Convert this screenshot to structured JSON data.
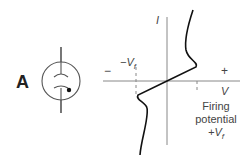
{
  "figure": {
    "panel_label": "A",
    "component": "gas-discharge-tube-symbol",
    "axes": {
      "x_label": "V",
      "y_label": "I",
      "negative_sign": "−",
      "positive_sign": "+"
    },
    "annotations": {
      "neg_threshold": "−V",
      "neg_threshold_sub": "f",
      "firing_line1": "Firing",
      "firing_line2": "potential",
      "pos_threshold": "+V",
      "pos_threshold_sub": "f"
    },
    "colors": {
      "curve": "#111111",
      "axes": "#888888",
      "symbol": "#555555",
      "text": "#444444"
    }
  }
}
